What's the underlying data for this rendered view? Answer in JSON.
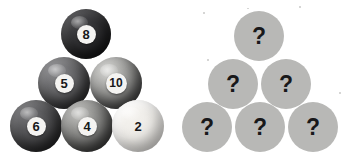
{
  "canvas": {
    "width": 350,
    "height": 168,
    "background": "#ffffff"
  },
  "panels": {
    "known": {
      "name": "numbered-ball-pyramid",
      "arrangement": "triangle-3-rows",
      "balls": [
        {
          "label": "8",
          "row": 1,
          "cx": 86,
          "cy": 34,
          "r": 25,
          "color": "#2c2c2e",
          "disc": 19,
          "font": 13
        },
        {
          "label": "5",
          "row": 2,
          "cx": 64,
          "cy": 83,
          "r": 26,
          "color": "#5b5b5d",
          "disc": 19,
          "font": 13
        },
        {
          "label": "10",
          "row": 2,
          "cx": 116,
          "cy": 83,
          "r": 26,
          "color": "#8b8b89",
          "disc": 21,
          "font": 12
        },
        {
          "label": "6",
          "row": 3,
          "cx": 36,
          "cy": 126,
          "r": 26,
          "color": "#4a4a4c",
          "disc": 19,
          "font": 13
        },
        {
          "label": "4",
          "row": 3,
          "cx": 87,
          "cy": 126,
          "r": 26,
          "color": "#7c7c7a",
          "disc": 19,
          "font": 13
        },
        {
          "label": "2",
          "row": 3,
          "cx": 138,
          "cy": 126,
          "r": 26,
          "color": "#eceae6",
          "disc": 19,
          "font": 13,
          "pale": true
        }
      ]
    },
    "unknown": {
      "name": "mystery-ball-pyramid",
      "arrangement": "triangle-3-rows",
      "symbol": "?",
      "color": "#b8b8b6",
      "balls": [
        {
          "label": "?",
          "row": 1,
          "cx": 259,
          "cy": 36,
          "r": 25,
          "font": 23
        },
        {
          "label": "?",
          "row": 2,
          "cx": 233,
          "cy": 84,
          "r": 25,
          "font": 23
        },
        {
          "label": "?",
          "row": 2,
          "cx": 286,
          "cy": 84,
          "r": 25,
          "font": 23
        },
        {
          "label": "?",
          "row": 3,
          "cx": 207,
          "cy": 127,
          "r": 25,
          "font": 23
        },
        {
          "label": "?",
          "row": 3,
          "cx": 260,
          "cy": 127,
          "r": 25,
          "font": 23
        },
        {
          "label": "?",
          "row": 3,
          "cx": 313,
          "cy": 127,
          "r": 25,
          "font": 23
        }
      ]
    }
  },
  "specks": [
    {
      "x": 203,
      "y": 12,
      "w": 2,
      "h": 2
    },
    {
      "x": 247,
      "y": 8,
      "w": 2,
      "h": 1
    },
    {
      "x": 299,
      "y": 6,
      "w": 2,
      "h": 2
    },
    {
      "x": 207,
      "y": 59,
      "w": 2,
      "h": 2
    },
    {
      "x": 339,
      "y": 92,
      "w": 2,
      "h": 2
    }
  ]
}
